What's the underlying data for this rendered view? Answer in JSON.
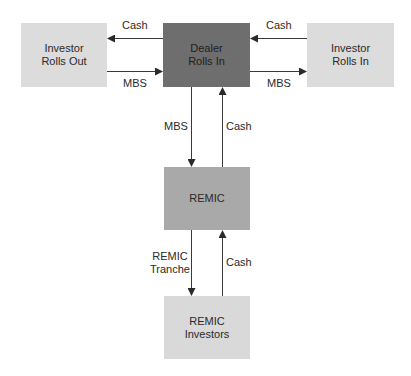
{
  "diagram": {
    "nodes": {
      "investor_rolls_out": {
        "lines": [
          "Investor",
          "Rolls Out"
        ],
        "fill": "#dcdcdc"
      },
      "dealer_rolls_in": {
        "lines": [
          "Dealer",
          "Rolls In"
        ],
        "fill": "#6e6e6e"
      },
      "investor_rolls_in": {
        "lines": [
          "Investor",
          "Rolls In"
        ],
        "fill": "#dcdcdc"
      },
      "remic": {
        "lines": [
          "REMIC"
        ],
        "fill": "#a9a9a9"
      },
      "remic_investors": {
        "lines": [
          "REMIC",
          "Investors"
        ],
        "fill": "#d9d9d9"
      }
    },
    "edges": {
      "dealer_to_out_cash": {
        "label": "Cash",
        "from": "Dealer Rolls In",
        "to": "Investor Rolls Out"
      },
      "out_to_dealer_mbs": {
        "label": "MBS",
        "from": "Investor Rolls Out",
        "to": "Dealer Rolls In"
      },
      "in_to_dealer_cash": {
        "label": "Cash",
        "from": "Investor Rolls In",
        "to": "Dealer Rolls In"
      },
      "dealer_to_in_mbs": {
        "label": "MBS",
        "from": "Dealer Rolls In",
        "to": "Investor Rolls In"
      },
      "dealer_to_remic_mbs": {
        "label": "MBS",
        "from": "Dealer Rolls In",
        "to": "REMIC"
      },
      "remic_to_dealer_cash": {
        "label": "Cash",
        "from": "REMIC",
        "to": "Dealer Rolls In"
      },
      "remic_to_investors_tranche": {
        "lines": [
          "REMIC",
          "Tranche"
        ],
        "from": "REMIC",
        "to": "REMIC Investors"
      },
      "investors_to_remic_cash": {
        "label": "Cash",
        "from": "REMIC Investors",
        "to": "REMIC"
      }
    },
    "line_color": "#3a3a3a"
  }
}
